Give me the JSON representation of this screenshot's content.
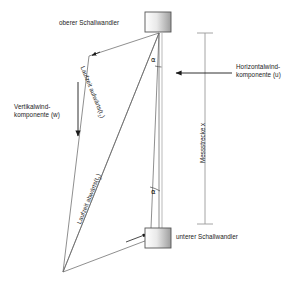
{
  "figure": {
    "kind": "ultrasonic-anemometer-sound-path-diagram",
    "background_color": "#ffffff",
    "line_color": "#5a5a5a",
    "text_color": "#1a1a1a"
  },
  "labels": {
    "upper_transducer": "oberer Schallwandler",
    "lower_transducer": "unterer Schallwandler",
    "horizontal_wind_line1": "Horizontalwind-",
    "horizontal_wind_line2": "komponente (u)",
    "vertical_wind_line1": "Vertikalwind-",
    "vertical_wind_line2": "komponente (w)",
    "measurement_distance": "Messstrecke x",
    "travel_time_up": "Laufzeit aufwärts",
    "travel_time_up_symbol": "(t",
    "travel_time_up_sub": "1",
    "travel_time_up_close": ")",
    "travel_time_down": "Laufzeit abwärts",
    "travel_time_down_symbol": "(t",
    "travel_time_down_sub": "2",
    "travel_time_down_close": ")",
    "angle_upper": "α",
    "angle_lower": "α"
  },
  "geometry": {
    "upper_transducer_box": {
      "x": 145,
      "y": 12,
      "w": 26,
      "h": 20
    },
    "lower_transducer_box": {
      "x": 145,
      "y": 228,
      "w": 26,
      "h": 20
    },
    "measurement_line_x": 205,
    "measurement_line_top": 33,
    "measurement_line_bottom": 224,
    "horizontal_arrow_y": 73,
    "horizontal_arrow_from_x": 232,
    "horizontal_arrow_to_x": 171,
    "vertical_arrow_x": 78,
    "vertical_arrow_from_y": 82,
    "vertical_arrow_to_y": 141,
    "apex_bottom_left": {
      "x": 63,
      "y": 272
    },
    "vertical_path_top": {
      "x": 159,
      "y": 32
    },
    "vertical_path_bottom": {
      "x": 159,
      "y": 228
    }
  }
}
